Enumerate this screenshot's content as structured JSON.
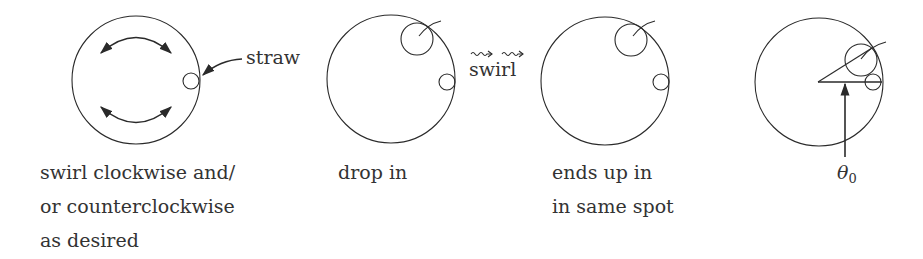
{
  "figure": {
    "panels": [
      {
        "id": "swirl-setup",
        "caption_lines": [
          "swirl clockwise and/",
          "or counterclockwise",
          "as desired"
        ],
        "callout": "straw"
      },
      {
        "id": "drop-in",
        "caption_lines": [
          "drop in"
        ]
      },
      {
        "id": "ends-up",
        "caption_lines": [
          "ends up in",
          "in same spot"
        ]
      },
      {
        "id": "angle",
        "angle_symbol": "θ",
        "angle_subscript": "0"
      }
    ],
    "transition": {
      "symbol": "⇝ ⇝",
      "label": "swirl"
    },
    "colors": {
      "stroke": "#2a2a2a",
      "text": "#333333",
      "background": "#ffffff"
    }
  }
}
